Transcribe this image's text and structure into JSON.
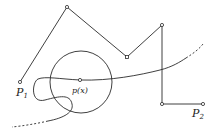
{
  "diagram": {
    "labels": {
      "p1": "P",
      "p1_sub": "1",
      "p2": "P",
      "p2_sub": "2",
      "px": "p(x)"
    },
    "colors": {
      "stroke": "#2a2a2a",
      "background": "#ffffff"
    },
    "polyline_vertices": [
      [
        20,
        82
      ],
      [
        67,
        7
      ],
      [
        127,
        57
      ],
      [
        162,
        25
      ],
      [
        162,
        104
      ],
      [
        203,
        104
      ]
    ],
    "circle": {
      "cx": 81,
      "cy": 82,
      "r": 31
    },
    "center_point": [
      80,
      80
    ]
  }
}
